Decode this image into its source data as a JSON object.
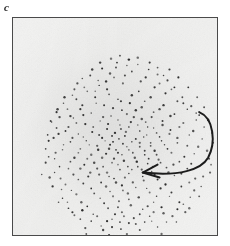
{
  "panel": {
    "label": "c",
    "frame": {
      "x": 12,
      "y": 17,
      "width": 206,
      "height": 219
    },
    "border_color": "#4a4a4a",
    "background_color": "#f2f2f1"
  },
  "annotation": {
    "arrow": {
      "name": "curved-rotation-arrow",
      "color": "#1c1c1c",
      "stroke_width": 2.0,
      "direction": "counter-clockwise-sweep-pointing-left",
      "tail_point": [
        188,
        95
      ],
      "control_points": [
        [
          206,
          108
        ],
        [
          204,
          142
        ],
        [
          176,
          153
        ]
      ],
      "head_tip": [
        131,
        156
      ],
      "head_barbs": [
        [
          146,
          148
        ],
        [
          148,
          161
        ]
      ],
      "path": "M 188 95 C 203 101 205 126 197 141 C 190 153 168 160 132 156"
    }
  },
  "chart_data": {
    "type": "scatter",
    "title": "",
    "subtitle": "",
    "xlabel": "",
    "ylabel": "",
    "legend": [],
    "grid": false,
    "axis_ticks": false,
    "panel_letter": "c",
    "point_color": "#2b2b2b",
    "point_size_px": 1.8,
    "n_points": 352,
    "distribution": "elliptical-gaussian-cloud",
    "center": [
      112,
      128
    ],
    "spread": [
      56,
      44
    ],
    "xlim": [
      0,
      206
    ],
    "ylim": [
      0,
      219
    ],
    "points": [
      [
        105,
        45
      ],
      [
        98,
        56
      ],
      [
        120,
        54
      ],
      [
        86,
        63
      ],
      [
        134,
        60
      ],
      [
        111,
        66
      ],
      [
        72,
        70
      ],
      [
        148,
        66
      ],
      [
        95,
        72
      ],
      [
        127,
        74
      ],
      [
        60,
        78
      ],
      [
        160,
        72
      ],
      [
        83,
        80
      ],
      [
        139,
        80
      ],
      [
        106,
        82
      ],
      [
        118,
        86
      ],
      [
        51,
        86
      ],
      [
        171,
        80
      ],
      [
        92,
        88
      ],
      [
        130,
        90
      ],
      [
        68,
        92
      ],
      [
        152,
        88
      ],
      [
        110,
        93
      ],
      [
        79,
        96
      ],
      [
        142,
        95
      ],
      [
        44,
        95
      ],
      [
        180,
        89
      ],
      [
        99,
        99
      ],
      [
        122,
        100
      ],
      [
        61,
        101
      ],
      [
        163,
        97
      ],
      [
        88,
        104
      ],
      [
        134,
        105
      ],
      [
        73,
        107
      ],
      [
        151,
        104
      ],
      [
        108,
        108
      ],
      [
        38,
        104
      ],
      [
        188,
        98
      ],
      [
        117,
        110
      ],
      [
        95,
        112
      ],
      [
        142,
        111
      ],
      [
        56,
        110
      ],
      [
        172,
        106
      ],
      [
        128,
        114
      ],
      [
        80,
        115
      ],
      [
        103,
        116
      ],
      [
        159,
        113
      ],
      [
        66,
        117
      ],
      [
        135,
        118
      ],
      [
        113,
        119
      ],
      [
        46,
        117
      ],
      [
        182,
        114
      ],
      [
        90,
        121
      ],
      [
        148,
        120
      ],
      [
        124,
        122
      ],
      [
        74,
        124
      ],
      [
        101,
        125
      ],
      [
        166,
        121
      ],
      [
        58,
        125
      ],
      [
        139,
        126
      ],
      [
        111,
        127
      ],
      [
        85,
        129
      ],
      [
        153,
        128
      ],
      [
        36,
        124
      ],
      [
        191,
        122
      ],
      [
        128,
        130
      ],
      [
        68,
        132
      ],
      [
        97,
        132
      ],
      [
        176,
        129
      ],
      [
        117,
        133
      ],
      [
        143,
        134
      ],
      [
        50,
        133
      ],
      [
        106,
        136
      ],
      [
        79,
        138
      ],
      [
        160,
        136
      ],
      [
        133,
        138
      ],
      [
        90,
        141
      ],
      [
        123,
        141
      ],
      [
        62,
        141
      ],
      [
        183,
        137
      ],
      [
        147,
        143
      ],
      [
        112,
        144
      ],
      [
        100,
        146
      ],
      [
        72,
        148
      ],
      [
        136,
        147
      ],
      [
        168,
        145
      ],
      [
        42,
        142
      ],
      [
        126,
        150
      ],
      [
        85,
        152
      ],
      [
        155,
        151
      ],
      [
        108,
        153
      ],
      [
        95,
        156
      ],
      [
        56,
        152
      ],
      [
        176,
        152
      ],
      [
        140,
        155
      ],
      [
        117,
        157
      ],
      [
        76,
        160
      ],
      [
        131,
        160
      ],
      [
        102,
        162
      ],
      [
        163,
        159
      ],
      [
        66,
        163
      ],
      [
        146,
        163
      ],
      [
        89,
        166
      ],
      [
        121,
        166
      ],
      [
        110,
        169
      ],
      [
        48,
        162
      ],
      [
        184,
        162
      ],
      [
        154,
        168
      ],
      [
        79,
        172
      ],
      [
        135,
        172
      ],
      [
        98,
        175
      ],
      [
        116,
        177
      ],
      [
        59,
        174
      ],
      [
        170,
        170
      ],
      [
        127,
        181
      ],
      [
        88,
        182
      ],
      [
        145,
        180
      ],
      [
        107,
        185
      ],
      [
        69,
        186
      ],
      [
        158,
        180
      ],
      [
        119,
        189
      ],
      [
        96,
        192
      ],
      [
        136,
        190
      ],
      [
        50,
        182
      ],
      [
        179,
        181
      ],
      [
        110,
        196
      ],
      [
        81,
        198
      ],
      [
        150,
        191
      ],
      [
        128,
        198
      ],
      [
        100,
        203
      ],
      [
        62,
        199
      ],
      [
        166,
        193
      ],
      [
        117,
        207
      ],
      [
        140,
        205
      ],
      [
        89,
        210
      ],
      [
        109,
        213
      ],
      [
        73,
        212
      ],
      [
        155,
        206
      ],
      [
        128,
        214
      ],
      [
        97,
        219
      ],
      [
        43,
        136
      ],
      [
        196,
        134
      ],
      [
        33,
        146
      ],
      [
        200,
        148
      ],
      [
        29,
        158
      ],
      [
        192,
        160
      ],
      [
        40,
        170
      ],
      [
        183,
        174
      ],
      [
        55,
        186
      ],
      [
        172,
        188
      ],
      [
        104,
        50
      ],
      [
        115,
        48
      ],
      [
        90,
        51
      ],
      [
        126,
        47
      ],
      [
        137,
        52
      ],
      [
        78,
        58
      ],
      [
        146,
        57
      ],
      [
        65,
        66
      ],
      [
        156,
        63
      ],
      [
        102,
        60
      ],
      [
        113,
        58
      ],
      [
        129,
        64
      ],
      [
        87,
        68
      ],
      [
        143,
        70
      ],
      [
        75,
        74
      ],
      [
        154,
        76
      ],
      [
        97,
        77
      ],
      [
        120,
        78
      ],
      [
        64,
        82
      ],
      [
        166,
        84
      ],
      [
        109,
        84
      ],
      [
        133,
        84
      ],
      [
        84,
        86
      ],
      [
        148,
        92
      ],
      [
        55,
        92
      ],
      [
        176,
        92
      ],
      [
        101,
        91
      ],
      [
        124,
        93
      ],
      [
        71,
        98
      ],
      [
        159,
        99
      ],
      [
        115,
        97
      ],
      [
        91,
        100
      ],
      [
        140,
        100
      ],
      [
        47,
        100
      ],
      [
        185,
        103
      ],
      [
        106,
        103
      ],
      [
        130,
        102
      ],
      [
        64,
        106
      ],
      [
        151,
        108
      ],
      [
        96,
        107
      ],
      [
        119,
        105
      ],
      [
        81,
        110
      ],
      [
        168,
        110
      ],
      [
        136,
        110
      ],
      [
        53,
        114
      ],
      [
        109,
        112
      ],
      [
        126,
        108
      ],
      [
        87,
        118
      ],
      [
        158,
        117
      ],
      [
        145,
        116
      ],
      [
        71,
        120
      ],
      [
        178,
        118
      ],
      [
        114,
        115
      ],
      [
        100,
        119
      ],
      [
        132,
        120
      ],
      [
        60,
        121
      ],
      [
        93,
        124
      ],
      [
        150,
        124
      ],
      [
        41,
        121
      ],
      [
        120,
        125
      ],
      [
        107,
        122
      ],
      [
        77,
        128
      ],
      [
        166,
        126
      ],
      [
        139,
        129
      ],
      [
        51,
        128
      ],
      [
        187,
        130
      ],
      [
        98,
        128
      ],
      [
        128,
        126
      ],
      [
        115,
        130
      ],
      [
        86,
        133
      ],
      [
        156,
        132
      ],
      [
        66,
        136
      ],
      [
        104,
        133
      ],
      [
        145,
        138
      ],
      [
        133,
        134
      ],
      [
        75,
        142
      ],
      [
        173,
        140
      ],
      [
        94,
        137
      ],
      [
        121,
        136
      ],
      [
        110,
        138
      ],
      [
        58,
        145
      ],
      [
        162,
        148
      ],
      [
        137,
        142
      ],
      [
        82,
        146
      ],
      [
        149,
        146
      ],
      [
        102,
        142
      ],
      [
        125,
        145
      ],
      [
        68,
        152
      ],
      [
        180,
        147
      ],
      [
        91,
        150
      ],
      [
        116,
        150
      ],
      [
        141,
        150
      ],
      [
        47,
        150
      ],
      [
        106,
        148
      ],
      [
        130,
        153
      ],
      [
        78,
        156
      ],
      [
        157,
        156
      ],
      [
        97,
        160
      ],
      [
        120,
        153
      ],
      [
        61,
        158
      ],
      [
        170,
        157
      ],
      [
        143,
        158
      ],
      [
        87,
        158
      ],
      [
        113,
        161
      ],
      [
        132,
        164
      ],
      [
        53,
        168
      ],
      [
        104,
        166
      ],
      [
        149,
        172
      ],
      [
        71,
        167
      ],
      [
        178,
        166
      ],
      [
        94,
        170
      ],
      [
        124,
        171
      ],
      [
        111,
        174
      ],
      [
        82,
        177
      ],
      [
        160,
        176
      ],
      [
        138,
        176
      ],
      [
        64,
        178
      ],
      [
        101,
        180
      ],
      [
        117,
        183
      ],
      [
        142,
        186
      ],
      [
        75,
        190
      ],
      [
        168,
        186
      ],
      [
        92,
        187
      ],
      [
        131,
        193
      ],
      [
        106,
        191
      ],
      [
        56,
        192
      ],
      [
        152,
        197
      ],
      [
        85,
        200
      ],
      [
        122,
        202
      ],
      [
        112,
        200
      ],
      [
        68,
        203
      ],
      [
        161,
        200
      ],
      [
        138,
        200
      ],
      [
        95,
        205
      ],
      [
        103,
        198
      ],
      [
        79,
        205
      ],
      [
        146,
        211
      ],
      [
        115,
        218
      ],
      [
        124,
        208
      ],
      [
        91,
        214
      ],
      [
        133,
        206
      ],
      [
        108,
        206
      ],
      [
        100,
        211
      ],
      [
        142,
        196
      ],
      [
        70,
        194
      ],
      [
        174,
        196
      ],
      [
        49,
        173
      ],
      [
        190,
        170
      ],
      [
        37,
        161
      ],
      [
        199,
        156
      ],
      [
        33,
        132
      ],
      [
        202,
        126
      ],
      [
        44,
        111
      ],
      [
        193,
        110
      ],
      [
        58,
        99
      ],
      [
        185,
        96
      ],
      [
        70,
        88
      ],
      [
        172,
        86
      ],
      [
        83,
        74
      ],
      [
        163,
        70
      ],
      [
        94,
        64
      ],
      [
        152,
        58
      ],
      [
        108,
        38
      ],
      [
        117,
        42
      ],
      [
        99,
        41
      ],
      [
        126,
        40
      ],
      [
        138,
        45
      ],
      [
        88,
        45
      ],
      [
        146,
        50
      ],
      [
        80,
        52
      ],
      [
        158,
        52
      ],
      [
        70,
        61
      ],
      [
        167,
        60
      ],
      [
        62,
        72
      ],
      [
        177,
        70
      ],
      [
        52,
        80
      ],
      [
        186,
        80
      ],
      [
        45,
        92
      ],
      [
        193,
        90
      ],
      [
        39,
        105
      ],
      [
        197,
        103
      ],
      [
        35,
        118
      ],
      [
        201,
        116
      ],
      [
        36,
        140
      ],
      [
        198,
        142
      ],
      [
        42,
        156
      ],
      [
        188,
        180
      ],
      [
        46,
        186
      ],
      [
        178,
        192
      ],
      [
        60,
        196
      ],
      [
        165,
        206
      ],
      [
        86,
        224
      ],
      [
        112,
        226
      ],
      [
        136,
        222
      ],
      [
        74,
        218
      ],
      [
        150,
        218
      ],
      [
        101,
        229
      ],
      [
        125,
        230
      ]
    ]
  }
}
